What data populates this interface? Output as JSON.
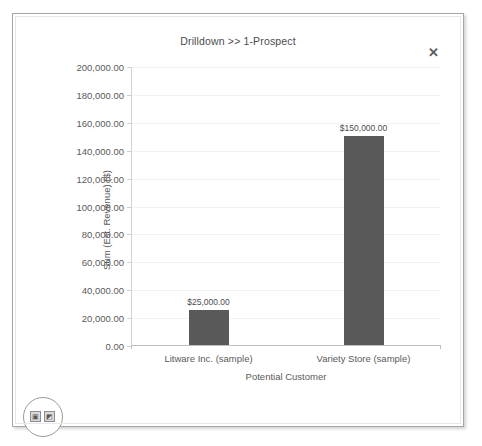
{
  "window": {
    "title": "Drilldown >> 1-Prospect",
    "close_label": "✕"
  },
  "badge": {
    "button_1_icon": "image-icon",
    "button_1_glyph": "▣",
    "button_2_icon": "chart-icon",
    "button_2_glyph": "◩"
  },
  "colors": {
    "bar": "#595959",
    "axis": "#bfbfbf",
    "gridline": "#f2f2f2",
    "text": "#5a5a5a",
    "frame": "#a6a6a6"
  },
  "chart_data": {
    "type": "bar",
    "title": "Drilldown >> 1-Prospect",
    "xlabel": "Potential Customer",
    "ylabel": "Sum (Est. Revenue) ($)",
    "categories": [
      "Litware Inc. (sample)",
      "Variety Store (sample)"
    ],
    "values": [
      25000,
      150000
    ],
    "value_labels": [
      "$25,000.00",
      "$150,000.00"
    ],
    "ylim": [
      0,
      200000
    ],
    "ytick_values": [
      0,
      20000,
      40000,
      60000,
      80000,
      100000,
      120000,
      140000,
      160000,
      180000,
      200000
    ],
    "ytick_labels": [
      "0.00",
      "20,000.00",
      "40,000.00",
      "60,000.00",
      "80,000.00",
      "100,000.00",
      "120,000.00",
      "140,000.00",
      "160,000.00",
      "180,000.00",
      "200,000.00"
    ],
    "grid": true,
    "legend": false,
    "series": [
      {
        "name": "Sum (Est. Revenue) ($)",
        "values": [
          25000,
          150000
        ]
      }
    ]
  }
}
